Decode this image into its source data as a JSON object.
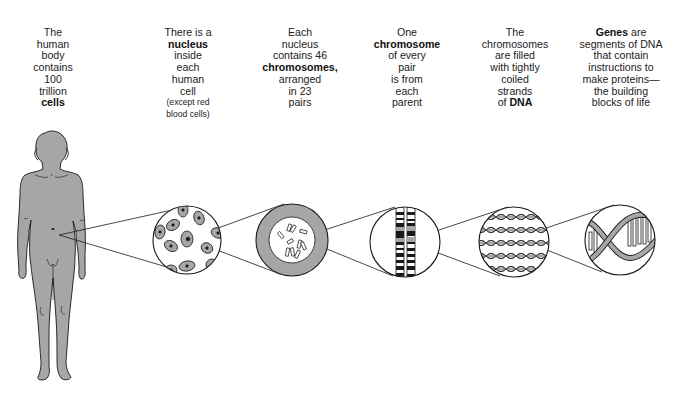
{
  "captions": [
    {
      "id": "body",
      "lines": [
        {
          "text": "The"
        },
        {
          "text": "human"
        },
        {
          "text": "body"
        },
        {
          "text": "contains"
        },
        {
          "text": "100"
        },
        {
          "text": "trillion"
        },
        {
          "text": "cells",
          "bold": true
        }
      ]
    },
    {
      "id": "cell",
      "lines": [
        {
          "text": "There is a"
        },
        {
          "text": "nucleus",
          "bold": true
        },
        {
          "text": "inside"
        },
        {
          "text": "each"
        },
        {
          "text": "human"
        },
        {
          "text": "cell"
        },
        {
          "text": "(except red",
          "small": true
        },
        {
          "text": "blood cells)",
          "small": true
        }
      ]
    },
    {
      "id": "nucleus",
      "lines": [
        {
          "text": "Each"
        },
        {
          "text": "nucleus"
        },
        {
          "text": "contains 46"
        },
        {
          "text": "chromosomes,",
          "bold": true
        },
        {
          "text": "arranged"
        },
        {
          "text": "in 23"
        },
        {
          "text": "pairs"
        }
      ]
    },
    {
      "id": "chromosome",
      "lines": [
        {
          "text": "One"
        },
        {
          "text": "chromosome",
          "bold": true
        },
        {
          "text": "of every"
        },
        {
          "text": "pair"
        },
        {
          "text": "is from"
        },
        {
          "text": "each"
        },
        {
          "text": "parent"
        }
      ]
    },
    {
      "id": "dna",
      "lines": [
        {
          "text": "The"
        },
        {
          "text": "chromosomes"
        },
        {
          "text": "are filled"
        },
        {
          "text": "with tightly"
        },
        {
          "text": "coiled"
        },
        {
          "text": "strands"
        },
        {
          "text": "of ",
          "suffix_bold": "DNA"
        }
      ]
    },
    {
      "id": "genes",
      "lines": [
        {
          "text": " are",
          "prefix_bold": "Genes"
        },
        {
          "text": "segments of DNA"
        },
        {
          "text": "that contain"
        },
        {
          "text": "instructions to"
        },
        {
          "text": "make proteins—"
        },
        {
          "text": "the building"
        },
        {
          "text": "blocks of life"
        }
      ]
    }
  ],
  "panels": [
    {
      "name": "human-body-figure",
      "label": "human body"
    },
    {
      "name": "cells-magnified-circle",
      "label": "cells with nuclei"
    },
    {
      "name": "nucleus-magnified-circle",
      "label": "nucleus with chromosomes"
    },
    {
      "name": "chromosome-pair-circle",
      "label": "chromosome pair"
    },
    {
      "name": "dna-strands-circle",
      "label": "coiled DNA strands"
    },
    {
      "name": "gene-double-helix-circle",
      "label": "DNA double helix"
    }
  ],
  "colors": {
    "figure_fill": "#a6a6a6",
    "outline": "#1a1a1a",
    "text": "#222222",
    "background": "#ffffff"
  }
}
